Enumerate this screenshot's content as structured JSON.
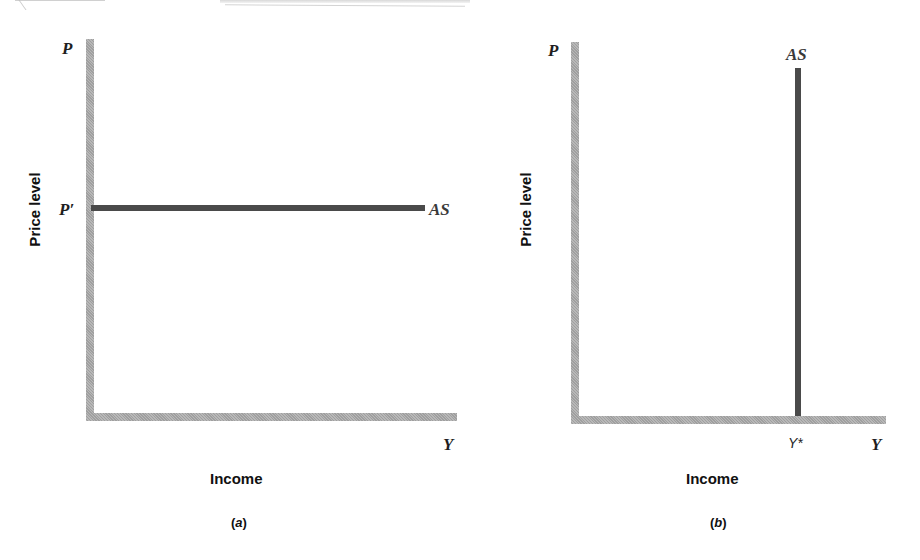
{
  "diagram": {
    "type": "aggregate-supply-diagrams",
    "panels": [
      {
        "id": "a",
        "caption_open": "(",
        "caption_letter": "a",
        "caption_close": ")",
        "y_axis_symbol": "P",
        "y_axis_title": "Price level",
        "x_axis_symbol": "Y",
        "x_axis_title": "Income",
        "price_marker": "P′",
        "curve_label": "AS",
        "curve_shape": "horizontal",
        "colors": {
          "axis": "#a8a8a8",
          "curve": "#4a4a4a"
        }
      },
      {
        "id": "b",
        "caption_open": "(",
        "caption_letter": "b",
        "caption_close": ")",
        "y_axis_symbol": "P",
        "y_axis_title": "Price level",
        "x_axis_symbol": "Y",
        "x_axis_title": "Income",
        "income_marker": "Y*",
        "curve_label": "AS",
        "curve_shape": "vertical",
        "colors": {
          "axis": "#a8a8a8",
          "curve": "#4a4a4a"
        }
      }
    ]
  }
}
